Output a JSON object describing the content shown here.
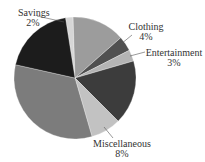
{
  "chart_data": {
    "type": "pie",
    "title": "",
    "center": [
      75,
      78
    ],
    "radius": 61,
    "start_angle_deg": -9,
    "slices": [
      {
        "name": "Savings",
        "value": 2,
        "label": "Savings",
        "pct_label": "2%",
        "color": "#d6d6d6",
        "labeled": true
      },
      {
        "name": "Unlabeled A",
        "value": 14,
        "label": "",
        "pct_label": "",
        "color": "#9c9c9c",
        "labeled": false
      },
      {
        "name": "Clothing",
        "value": 4,
        "label": "Clothing",
        "pct_label": "4%",
        "color": "#505050",
        "labeled": true
      },
      {
        "name": "Entertainment",
        "value": 3,
        "label": "Entertainment",
        "pct_label": "3%",
        "color": "#b4b4b4",
        "labeled": true
      },
      {
        "name": "Unlabeled B",
        "value": 17,
        "label": "",
        "pct_label": "",
        "color": "#3c3c3c",
        "labeled": false
      },
      {
        "name": "Miscellaneous",
        "value": 8,
        "label": "Miscellaneous",
        "pct_label": "8%",
        "color": "#c2c2c2",
        "labeled": true
      },
      {
        "name": "Unlabeled C",
        "value": 33,
        "label": "",
        "pct_label": "",
        "color": "#7c7c7c",
        "labeled": false
      },
      {
        "name": "Unlabeled D",
        "value": 19,
        "label": "",
        "pct_label": "",
        "color": "#1c1c1c",
        "labeled": false
      }
    ],
    "legend": "none"
  },
  "labels": {
    "savings": {
      "name": "Savings",
      "pct": "2%"
    },
    "clothing": {
      "name": "Clothing",
      "pct": "4%"
    },
    "entertainment": {
      "name": "Entertainment",
      "pct": "3%"
    },
    "miscellaneous": {
      "name": "Miscellaneous",
      "pct": "8%"
    }
  }
}
